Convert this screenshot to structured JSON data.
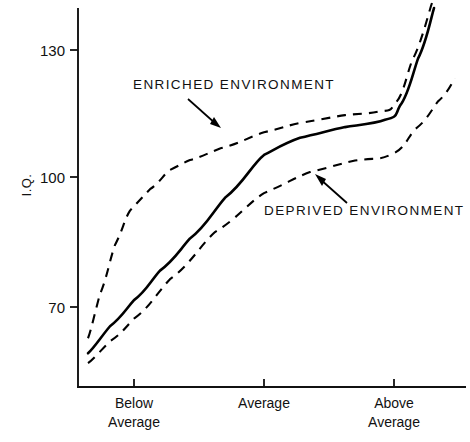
{
  "chart_data": {
    "type": "line",
    "title": "",
    "subtitle": "",
    "xlabel": "",
    "ylabel": "I.Q.",
    "ylim": [
      50,
      145
    ],
    "yticks": [
      70,
      100,
      130
    ],
    "ytick_labels": [
      "70",
      "100",
      "130"
    ],
    "grid": false,
    "legend_position": "inline-annotations",
    "x_categories": [
      "Below Average",
      "Average",
      "Above Average"
    ],
    "x_category_lines": [
      [
        "Below",
        "Average"
      ],
      [
        "Average",
        ""
      ],
      [
        "Above",
        "Average"
      ]
    ],
    "x_tick_positions_px": [
      134,
      264,
      394
    ],
    "series": [
      {
        "name": "Enriched Environment",
        "style": "dashed",
        "points": [
          {
            "x": 88,
            "iq": 62.7
          },
          {
            "x": 100,
            "iq": 73.0
          },
          {
            "x": 115,
            "iq": 84.5
          },
          {
            "x": 130,
            "iq": 92.5
          },
          {
            "x": 150,
            "iq": 97.5
          },
          {
            "x": 170,
            "iq": 102.0
          },
          {
            "x": 190,
            "iq": 104.3
          },
          {
            "x": 220,
            "iq": 107.0
          },
          {
            "x": 264,
            "iq": 110.8
          },
          {
            "x": 300,
            "iq": 113.0
          },
          {
            "x": 345,
            "iq": 114.8
          },
          {
            "x": 378,
            "iq": 115.6
          },
          {
            "x": 395,
            "iq": 117.5
          },
          {
            "x": 412,
            "iq": 127.5
          },
          {
            "x": 432,
            "iq": 141.0
          }
        ]
      },
      {
        "name": "Mean",
        "style": "solid",
        "points": [
          {
            "x": 88,
            "iq": 59.2
          },
          {
            "x": 110,
            "iq": 65.5
          },
          {
            "x": 134,
            "iq": 71.6
          },
          {
            "x": 160,
            "iq": 78.5
          },
          {
            "x": 190,
            "iq": 86.0
          },
          {
            "x": 225,
            "iq": 95.5
          },
          {
            "x": 264,
            "iq": 105.5
          },
          {
            "x": 300,
            "iq": 109.5
          },
          {
            "x": 345,
            "iq": 112.0
          },
          {
            "x": 385,
            "iq": 113.7
          },
          {
            "x": 400,
            "iq": 117.0
          },
          {
            "x": 418,
            "iq": 128.0
          },
          {
            "x": 434,
            "iq": 139.8
          }
        ]
      },
      {
        "name": "Deprived Environment",
        "style": "dashed",
        "points": [
          {
            "x": 88,
            "iq": 56.9
          },
          {
            "x": 110,
            "iq": 62.0
          },
          {
            "x": 134,
            "iq": 67.3
          },
          {
            "x": 170,
            "iq": 76.5
          },
          {
            "x": 215,
            "iq": 87.5
          },
          {
            "x": 264,
            "iq": 96.6
          },
          {
            "x": 310,
            "iq": 101.5
          },
          {
            "x": 355,
            "iq": 104.2
          },
          {
            "x": 390,
            "iq": 105.5
          },
          {
            "x": 415,
            "iq": 111.5
          },
          {
            "x": 438,
            "iq": 118.0
          },
          {
            "x": 455,
            "iq": 123.4
          }
        ]
      }
    ],
    "annotations": [
      {
        "name": "enriched-environment-label",
        "text": "ENRICHED  ENVIRONMENT",
        "text_x": 133,
        "text_y": 89,
        "arrow_from": [
          188,
          99
        ],
        "arrow_to": [
          219,
          127
        ]
      },
      {
        "name": "deprived-environment-label",
        "text": "DEPRIVED  ENVIRONMENT",
        "text_x": 264,
        "text_y": 215,
        "arrow_from": [
          347,
          203
        ],
        "arrow_to": [
          317,
          176
        ]
      }
    ],
    "colors": {
      "axis": "#111111",
      "mean_line": "#000000",
      "band_line": "#000000",
      "background": "#ffffff"
    }
  }
}
